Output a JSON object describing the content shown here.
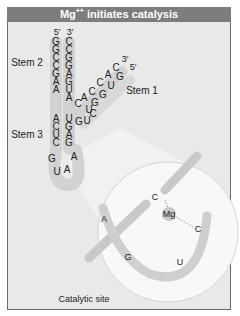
{
  "title": {
    "prefix": "Mg",
    "superscript": "++",
    "suffix": " initiates catalysis"
  },
  "colors": {
    "header_bg": "#7d7d7d",
    "frame_bg": "#e9e9e9",
    "strand_fill": "#cfcfcf",
    "circle_fill": "#f7f7f7",
    "text": "#222222"
  },
  "stems": {
    "stem1_label": "Stem 1",
    "stem2_label": "Stem 2",
    "stem3_label": "Stem 3"
  },
  "ends": {
    "left_top": "5′",
    "right_top": "3′",
    "stem1_3prime": "3′",
    "stem1_5prime": "5′"
  },
  "left_strand_upper": [
    "G",
    "G",
    "C",
    "C",
    "G",
    "A",
    "A"
  ],
  "left_strand_lower": [
    "A",
    "C",
    "U",
    "C"
  ],
  "right_strand": [
    "C",
    "C",
    "G",
    "G",
    "A",
    "G",
    "U",
    "A",
    "U",
    "G",
    "A",
    "G"
  ],
  "stem1_upper": [
    "C",
    "A",
    "C",
    "C",
    "A",
    "C"
  ],
  "stem1_lower": [
    "U",
    "G",
    "G",
    "U",
    "G"
  ],
  "junction": [
    "G",
    "U",
    "C"
  ],
  "loop": [
    "G",
    "U",
    "A",
    "A"
  ],
  "catalytic_site": {
    "label": "Catalytic site",
    "mg_label": "Mg",
    "nucleotides": {
      "c_top": "C",
      "c_right": "C",
      "a": "A",
      "g": "G",
      "u": "U"
    }
  }
}
